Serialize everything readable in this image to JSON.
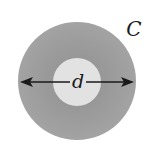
{
  "diagram": {
    "outer_label": "C",
    "dimension_label": "d",
    "colors": {
      "outer_ring": "#9a9a9a",
      "inner_disk": "#e2e2e2",
      "arrow": "#1a1a1a",
      "text": "#1a1a1a",
      "background": "#ffffff"
    }
  }
}
